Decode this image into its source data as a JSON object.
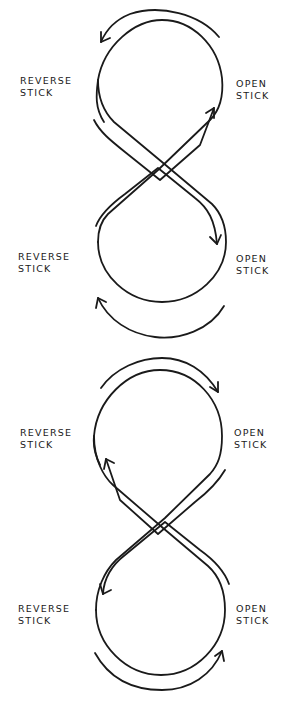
{
  "colors": {
    "ink": "#1a1a1a",
    "background": "#ffffff"
  },
  "figures": [
    {
      "name": "figure-1",
      "labels": {
        "top_left": {
          "line1": "Reverse",
          "line2": "Stick"
        },
        "top_right": {
          "line1": "Open",
          "line2": "Stick"
        },
        "bottom_left": {
          "line1": "Reverse",
          "line2": "Stick"
        },
        "bottom_right": {
          "line1": "Open",
          "line2": "Stick"
        }
      },
      "arrows": {
        "top_loop": "counter-clockwise (arrow pointing left at top-left)",
        "crossing_up": "toward top-right (Open Stick)",
        "crossing_down": "toward bottom-right (Open Stick)",
        "bottom_loop": "clockwise arrow pointing up at bottom-left"
      }
    },
    {
      "name": "figure-2",
      "labels": {
        "top_left": {
          "line1": "Reverse",
          "line2": "Stick"
        },
        "top_right": {
          "line1": "Open",
          "line2": "Stick"
        },
        "bottom_left": {
          "line1": "Reverse",
          "line2": "Stick"
        },
        "bottom_right": {
          "line1": "Open",
          "line2": "Stick"
        }
      },
      "arrows": {
        "top_loop": "clockwise (arrow pointing right at top-right)",
        "crossing_up": "toward top-left (Reverse Stick)",
        "crossing_down": "toward bottom-left (Reverse Stick)",
        "bottom_loop": "counter-clockwise arrow pointing up at bottom-right"
      }
    }
  ]
}
